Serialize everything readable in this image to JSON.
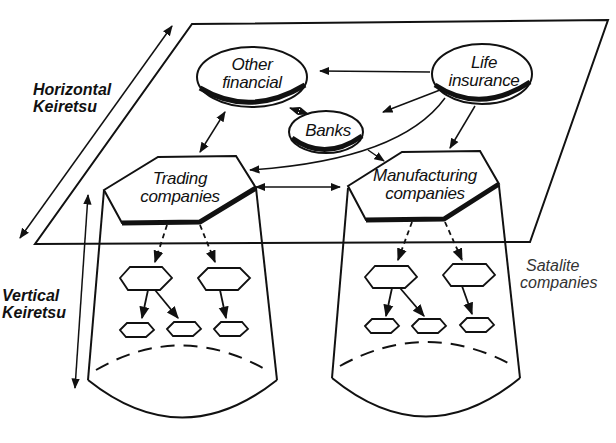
{
  "diagram": {
    "labels": {
      "horizontal": [
        "Horizontal",
        "Keiretsu"
      ],
      "vertical": [
        "Vertical",
        "Keiretsu"
      ],
      "satellite": [
        "Satalite",
        "companies"
      ]
    },
    "nodes": [
      {
        "id": "other_financial",
        "shape": "ellipse",
        "lines": [
          "Other",
          "financial"
        ]
      },
      {
        "id": "life_insurance",
        "shape": "ellipse",
        "lines": [
          "Life",
          "insurance"
        ]
      },
      {
        "id": "banks",
        "shape": "ellipse",
        "lines": [
          "Banks"
        ]
      },
      {
        "id": "trading",
        "shape": "hexagon",
        "lines": [
          "Trading",
          "companies"
        ]
      },
      {
        "id": "manufacturing",
        "shape": "hexagon",
        "lines": [
          "Manufacturing",
          "companies"
        ]
      }
    ],
    "edges": [
      {
        "from": "life_insurance",
        "to": "other_financial",
        "type": "arrow"
      },
      {
        "from": "life_insurance",
        "to": "banks",
        "type": "arrow"
      },
      {
        "from": "life_insurance",
        "to": "trading",
        "type": "arrow"
      },
      {
        "from": "life_insurance",
        "to": "manufacturing",
        "type": "arrow"
      },
      {
        "from": "other_financial",
        "to": "banks",
        "type": "bidirectional"
      },
      {
        "from": "other_financial",
        "to": "trading",
        "type": "bidirectional"
      },
      {
        "from": "banks",
        "to": "manufacturing",
        "type": "arrow"
      },
      {
        "from": "trading",
        "to": "manufacturing",
        "type": "bidirectional"
      }
    ],
    "satellite_tiers": {
      "level1_per_cone": 2,
      "level2_per_cone": 3
    }
  }
}
